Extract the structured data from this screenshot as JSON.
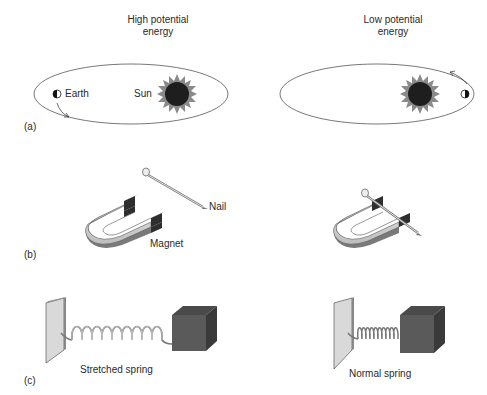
{
  "figure": {
    "panel_a": {
      "tag": "(a)",
      "left_header_line1": "High potential",
      "left_header_line2": "energy",
      "right_header_line1": "Low potential",
      "right_header_line2": "energy",
      "earth_label": "Earth",
      "sun_label": "Sun"
    },
    "panel_b": {
      "tag": "(b)",
      "nail_label": "Nail",
      "magnet_label": "Magnet"
    },
    "panel_c": {
      "tag": "(c)",
      "stretched_label": "Stretched spring",
      "normal_label": "Normal spring"
    },
    "colors": {
      "line": "#555555",
      "sun_core": "#1e1e1e",
      "sun_rays": "#8a8a8a",
      "magnet_light": "#cfcfcf",
      "magnet_dark": "#7a7a7a",
      "magnet_pole": "#2e2e2e",
      "block_front": "#5a5a5a",
      "block_top": "#4a4a4a",
      "block_side": "#3a3a3a",
      "wall": "#d9d9d9"
    }
  }
}
